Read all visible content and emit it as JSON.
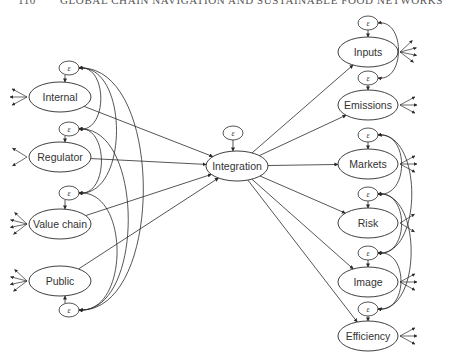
{
  "header": {
    "page_number": "110",
    "running_title": "GLOBAL CHAIN NAVIGATION AND SUSTAINABLE FOOD NETWORKS"
  },
  "diagram": {
    "type": "structural-equation-model",
    "error_symbol": "ε",
    "center": {
      "id": "integration",
      "label": "Integration",
      "x": 237,
      "y": 166,
      "rx": 31,
      "ry": 15,
      "eps": {
        "x": 233,
        "y": 133
      }
    },
    "left_nodes": [
      {
        "id": "internal",
        "label": "Internal",
        "x": 60,
        "y": 97,
        "rx": 31,
        "ry": 15,
        "indicators": 3,
        "eps": {
          "x": 69,
          "y": 68
        }
      },
      {
        "id": "regulator",
        "label": "Regulator",
        "x": 60,
        "y": 157,
        "rx": 31,
        "ry": 15,
        "indicators": 2,
        "eps": {
          "x": 69,
          "y": 129
        }
      },
      {
        "id": "value-chain",
        "label": "Value chain",
        "x": 60,
        "y": 224,
        "rx": 31,
        "ry": 15,
        "indicators": 4,
        "eps": {
          "x": 69,
          "y": 193
        }
      },
      {
        "id": "public",
        "label": "Public",
        "x": 60,
        "y": 281,
        "rx": 31,
        "ry": 15,
        "indicators": 4,
        "eps": {
          "x": 69,
          "y": 310
        }
      }
    ],
    "right_nodes": [
      {
        "id": "inputs",
        "label": "Inputs",
        "x": 368,
        "y": 52,
        "rx": 30,
        "ry": 15,
        "indicators": 4,
        "eps": {
          "x": 368,
          "y": 23
        }
      },
      {
        "id": "emissions",
        "label": "Emissions",
        "x": 368,
        "y": 105,
        "rx": 30,
        "ry": 15,
        "indicators": 3,
        "eps": {
          "x": 368,
          "y": 78
        }
      },
      {
        "id": "markets",
        "label": "Markets",
        "x": 368,
        "y": 164,
        "rx": 30,
        "ry": 15,
        "indicators": 3,
        "eps": {
          "x": 368,
          "y": 135
        }
      },
      {
        "id": "risk",
        "label": "Risk",
        "x": 368,
        "y": 223,
        "rx": 30,
        "ry": 15,
        "indicators": 2,
        "eps": {
          "x": 368,
          "y": 194
        }
      },
      {
        "id": "image",
        "label": "Image",
        "x": 368,
        "y": 282,
        "rx": 30,
        "ry": 15,
        "indicators": 3,
        "eps": {
          "x": 368,
          "y": 253
        }
      },
      {
        "id": "efficiency",
        "label": "Efficiency",
        "x": 368,
        "y": 336,
        "rx": 30,
        "ry": 15,
        "indicators": 3,
        "eps": {
          "x": 368,
          "y": 309
        }
      }
    ],
    "paths": [
      {
        "from": "internal",
        "to": "integration"
      },
      {
        "from": "regulator",
        "to": "integration"
      },
      {
        "from": "value-chain",
        "to": "integration"
      },
      {
        "from": "public",
        "to": "integration"
      },
      {
        "from": "integration",
        "to": "inputs"
      },
      {
        "from": "integration",
        "to": "emissions"
      },
      {
        "from": "integration",
        "to": "markets"
      },
      {
        "from": "integration",
        "to": "risk"
      },
      {
        "from": "integration",
        "to": "image"
      },
      {
        "from": "integration",
        "to": "efficiency"
      }
    ],
    "left_covariances": [
      [
        "internal",
        "regulator"
      ],
      [
        "internal",
        "value-chain"
      ],
      [
        "internal",
        "public"
      ],
      [
        "regulator",
        "value-chain"
      ],
      [
        "regulator",
        "public"
      ],
      [
        "value-chain",
        "public"
      ]
    ],
    "right_covariances": [
      [
        "inputs",
        "emissions"
      ],
      [
        "markets",
        "risk"
      ],
      [
        "markets",
        "image"
      ],
      [
        "risk",
        "image"
      ],
      [
        "risk",
        "efficiency"
      ],
      [
        "image",
        "efficiency"
      ]
    ],
    "colors": {
      "stroke": "#2a2a2a",
      "text": "#333333",
      "background": "#ffffff"
    }
  }
}
